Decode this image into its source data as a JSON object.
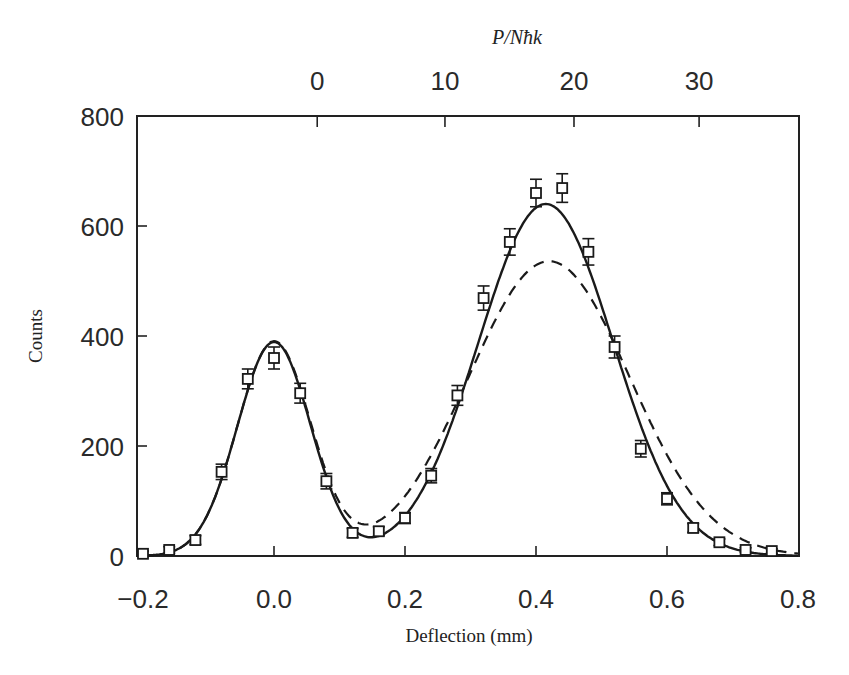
{
  "chart_data": {
    "type": "scatter",
    "title": "",
    "xlabel": "Deflection (mm)",
    "ylabel": "Counts",
    "top_xlabel": "P/Nħk",
    "xlim": [
      -0.2,
      0.8
    ],
    "ylim": [
      0,
      800
    ],
    "x_ticks": [
      -0.2,
      0.0,
      0.2,
      0.4,
      0.6,
      0.8
    ],
    "x_tick_labels": [
      "−0.2",
      "0.0",
      "0.2",
      "0.4",
      "0.6",
      "0.8"
    ],
    "y_ticks": [
      0,
      200,
      400,
      600,
      800
    ],
    "y_tick_labels": [
      "0",
      "200",
      "400",
      "600",
      "800"
    ],
    "top_ticks_deflection_mm": [
      0.066,
      0.261,
      0.458,
      0.649
    ],
    "top_tick_labels": [
      "0",
      "10",
      "20",
      "30"
    ],
    "grid": false,
    "legend": null,
    "series": [
      {
        "name": "Data",
        "style": "open-square markers with error bars",
        "x": [
          -0.2,
          -0.16,
          -0.12,
          -0.08,
          -0.04,
          0.0,
          0.04,
          0.08,
          0.12,
          0.16,
          0.2,
          0.24,
          0.28,
          0.32,
          0.36,
          0.4,
          0.44,
          0.48,
          0.52,
          0.56,
          0.6,
          0.64,
          0.68,
          0.72,
          0.76
        ],
        "y": [
          4,
          11,
          29,
          153,
          322,
          360,
          296,
          136,
          42,
          45,
          69,
          146,
          292,
          469,
          571,
          660,
          669,
          553,
          380,
          195,
          104,
          51,
          25,
          11,
          9
        ],
        "yerr": [
          5,
          6,
          8,
          14,
          18,
          20,
          18,
          14,
          8,
          8,
          10,
          13,
          18,
          22,
          24,
          25,
          26,
          24,
          20,
          15,
          11,
          8,
          6,
          4,
          4
        ]
      },
      {
        "name": "Fit (solid)",
        "style": "solid line",
        "model": "double gaussian",
        "components": [
          {
            "center": 0.0,
            "amplitude": 389,
            "sigma": 0.056
          },
          {
            "center": 0.415,
            "amplitude": 640,
            "sigma": 0.103
          }
        ],
        "peak_values": [
          389,
          643
        ]
      },
      {
        "name": "Model (dashed)",
        "style": "dashed line",
        "model": "double gaussian",
        "components": [
          {
            "center": 0.0,
            "amplitude": 389,
            "sigma": 0.056
          },
          {
            "center": 0.42,
            "amplitude": 536,
            "sigma": 0.123
          }
        ],
        "peak_values": [
          389,
          536
        ]
      }
    ]
  },
  "labels": {
    "xlabel": "Deflection (mm)",
    "ylabel": "Counts",
    "top_xlabel": "P/Nħk"
  }
}
